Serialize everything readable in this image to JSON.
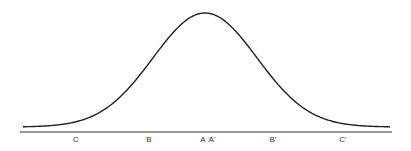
{
  "diagram": {
    "type": "bell-curve",
    "curve_color": "#222222",
    "axis_color": "#333333",
    "labels": [
      {
        "text": "C",
        "x": 76
      },
      {
        "text": "B",
        "x": 149
      },
      {
        "text": "A",
        "x": 203
      },
      {
        "text": "A'",
        "x": 212
      },
      {
        "text": "B'",
        "x": 273
      },
      {
        "text": "C'",
        "x": 343
      }
    ]
  }
}
